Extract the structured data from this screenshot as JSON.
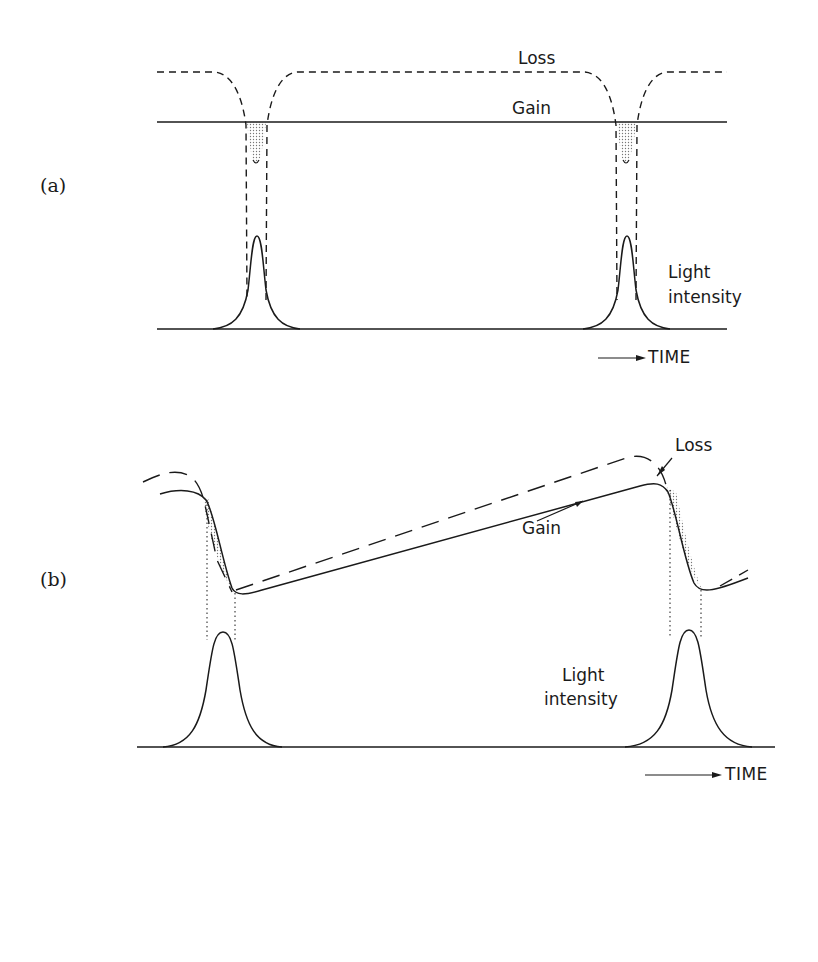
{
  "figure": {
    "panels": [
      {
        "id": "a",
        "label": "(a)",
        "curves": {
          "loss_label": "Loss",
          "gain_label": "Gain",
          "intensity_label_line1": "Light",
          "intensity_label_line2": "intensity"
        },
        "axis": {
          "time_label": "TIME"
        },
        "description": "Constant gain; loss modulated with sharp dips at each pulse; shaded net-gain window where loss drops below gain"
      },
      {
        "id": "b",
        "label": "(b)",
        "curves": {
          "loss_label": "Loss",
          "gain_label": "Gain",
          "intensity_label_line1": "Light",
          "intensity_label_line2": "intensity"
        },
        "axis": {
          "time_label": "TIME"
        },
        "description": "Gain and loss both saturate at each pulse and recover slowly; shaded net-gain window on the falling edges"
      }
    ],
    "colors": {
      "ink": "#1a1a1a",
      "background": "#ffffff",
      "shading": "#9a9a9a"
    }
  }
}
